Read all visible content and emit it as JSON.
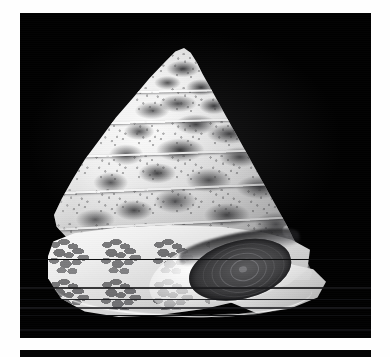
{
  "page": {
    "background_color": "#fefefe",
    "width": 390,
    "height": 357
  },
  "plate": {
    "name": "specimen-photograph",
    "background_color": "#010101",
    "x": 20,
    "y": 13,
    "width": 351,
    "height": 325,
    "description": "Black-background grayscale photograph of a single conical sea snail shell"
  },
  "lower_strip": {
    "name": "lower-black-band",
    "background_color": "#050505",
    "x": 20,
    "y": 350,
    "width": 351,
    "height": 7
  },
  "subject": {
    "label": "conical top-shell specimen",
    "orientation": "apex up, aperture facing lower right",
    "apex": {
      "x": 180,
      "y": 55
    },
    "base_left_tip": {
      "x": 70,
      "y": 272
    },
    "base_right_tip": {
      "x": 312,
      "y": 300
    },
    "shell_color": "#f0f0f0",
    "blotch_color": "#3a3a3c",
    "operculum_color": "#3a3a3c"
  },
  "parts": [
    {
      "key": "apex",
      "label": "apex"
    },
    {
      "key": "spire",
      "label": "spire whorls"
    },
    {
      "key": "body_whorl",
      "label": "body whorl"
    },
    {
      "key": "base",
      "label": "basal surface"
    },
    {
      "key": "aperture",
      "label": "aperture"
    },
    {
      "key": "operculum",
      "label": "operculum"
    },
    {
      "key": "outer_lip",
      "label": "outer lip"
    }
  ],
  "whorl_lines": [
    {
      "key": "whorl-1"
    },
    {
      "key": "whorl-2"
    },
    {
      "key": "whorl-3"
    },
    {
      "key": "whorl-4"
    },
    {
      "key": "whorl-5"
    }
  ],
  "scanlines": [
    {
      "key": "scan-f",
      "y": 246
    },
    {
      "key": "scan-a",
      "y": 274
    },
    {
      "key": "scan-b",
      "y": 286
    },
    {
      "key": "scan-c",
      "y": 294
    },
    {
      "key": "scan-d",
      "y": 302
    },
    {
      "key": "scan-e",
      "y": 316
    }
  ]
}
